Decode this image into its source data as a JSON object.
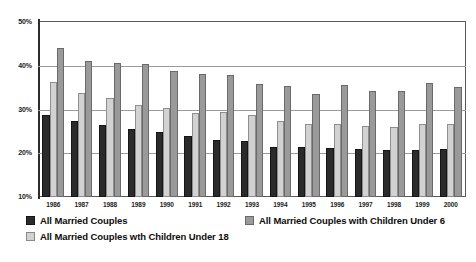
{
  "chart_data": {
    "type": "bar",
    "title": "",
    "subtitle": "",
    "xlabel": "",
    "ylabel": "",
    "ylim": [
      10,
      50
    ],
    "ytick_labels": [
      "10%",
      "20%",
      "30%",
      "40%",
      "50%"
    ],
    "ytick_values": [
      10,
      20,
      30,
      40,
      50
    ],
    "grid": true,
    "legend_position": "bottom",
    "categories": [
      "1986",
      "1987",
      "1988",
      "1989",
      "1990",
      "1991",
      "1992",
      "1993",
      "1994",
      "1995",
      "1996",
      "1997",
      "1998",
      "1999",
      "2000"
    ],
    "series": [
      {
        "name": "All Married Couples",
        "color": "#2b2b2b",
        "values": [
          28.8,
          27.4,
          26.4,
          25.6,
          24.8,
          24.0,
          23.0,
          22.8,
          21.5,
          21.4,
          21.2,
          21.0,
          20.8,
          20.8,
          21.0
        ]
      },
      {
        "name": "All Married Couples wth Children Under 18",
        "color": "#d2d2d2",
        "values": [
          36.3,
          33.8,
          32.6,
          31.0,
          30.4,
          29.2,
          29.4,
          28.8,
          27.4,
          26.8,
          26.8,
          26.2,
          26.0,
          26.8,
          26.6
        ]
      },
      {
        "name": "All Married Couples with Children Under 6",
        "color": "#9a9a9a",
        "values": [
          44.1,
          41.0,
          40.7,
          40.3,
          38.8,
          38.2,
          37.8,
          35.8,
          35.4,
          33.6,
          35.5,
          34.2,
          34.2,
          36.0,
          35.2
        ]
      }
    ],
    "source_note": ""
  },
  "legend": {
    "items": [
      {
        "label": "All Married Couples",
        "swatch": "dark-swatch"
      },
      {
        "label": "All Married Couples wth Children Under 18",
        "swatch": "light-gray-swatch"
      },
      {
        "label": "All Married Couples with Children Under 6",
        "swatch": "medium-gray-swatch"
      }
    ]
  }
}
